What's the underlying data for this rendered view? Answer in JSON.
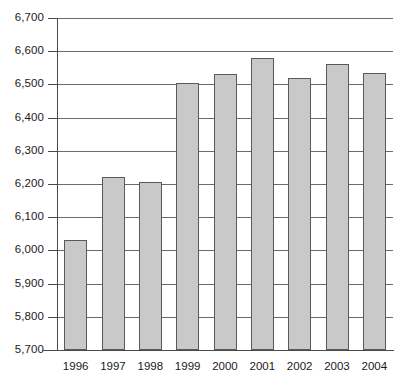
{
  "chart_data": {
    "type": "bar",
    "title": "",
    "subtitle": "",
    "xlabel": "",
    "ylabel": "",
    "categories": [
      "1996",
      "1997",
      "1998",
      "1999",
      "2000",
      "2001",
      "2002",
      "2003",
      "2004"
    ],
    "values": [
      6030,
      6220,
      6205,
      6505,
      6530,
      6580,
      6520,
      6560,
      6535
    ],
    "series": [
      {
        "name": "",
        "values": [
          6030,
          6220,
          6205,
          6505,
          6530,
          6580,
          6520,
          6560,
          6535
        ]
      }
    ],
    "ylim": [
      5700,
      6700
    ],
    "ytick_step": 100,
    "ytick_labels": [
      "6,700",
      "6,600",
      "6,500",
      "6,400",
      "6,300",
      "6,200",
      "6,100",
      "6,000",
      "5,900",
      "5,800",
      "5,700"
    ],
    "ytick_values": [
      6700,
      6600,
      6500,
      6400,
      6300,
      6200,
      6100,
      6000,
      5900,
      5800,
      5700
    ],
    "grid": true,
    "legend": "none",
    "colors": {
      "bar_fill": "#c9c9c9",
      "bar_border": "#5a5a5a",
      "gridline": "#6b6b6b",
      "axis": "#4a4a4a",
      "text": "#1a1a1a",
      "background": "#ffffff"
    }
  }
}
